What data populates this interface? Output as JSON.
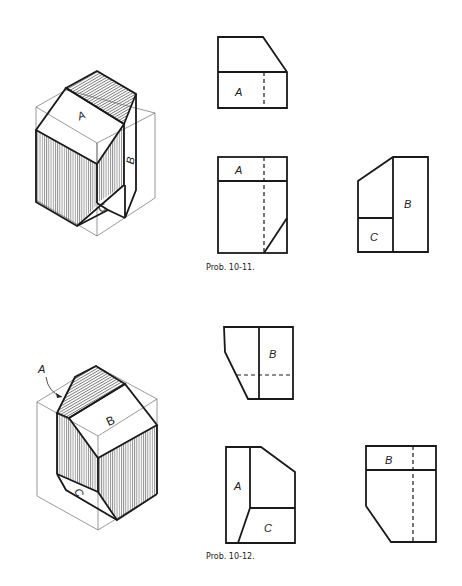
{
  "problems": [
    {
      "caption": "Prob. 10-11.",
      "isometric": {
        "labels": {
          "A": "A",
          "B": "B",
          "C": "C"
        }
      },
      "views": {
        "top": {
          "label": "A"
        },
        "front": {
          "label": "A"
        },
        "side": {
          "labels": {
            "B": "B",
            "C": "C"
          }
        }
      }
    },
    {
      "caption": "Prob. 10-12.",
      "isometric": {
        "labels": {
          "A": "A",
          "B": "B",
          "C": "C"
        }
      },
      "views": {
        "top": {
          "label": "B"
        },
        "front": {
          "labels": {
            "A": "A",
            "C": "C"
          }
        },
        "side": {
          "label": "B"
        }
      }
    }
  ],
  "colors": {
    "line": "#1a1a1a",
    "construction": "#555555",
    "background": "#ffffff"
  }
}
